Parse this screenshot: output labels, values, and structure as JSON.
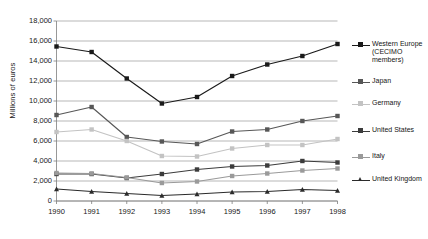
{
  "chart_data": {
    "type": "line",
    "title": "",
    "subtitle": "",
    "xlabel": "",
    "ylabel": "Millions of euros",
    "x": [
      1990,
      1991,
      1992,
      1993,
      1994,
      1995,
      1996,
      1997,
      1998
    ],
    "categories": [
      "1990",
      "1991",
      "1992",
      "1993",
      "1994",
      "1995",
      "1996",
      "1997",
      "1998"
    ],
    "ylim": [
      0,
      18000
    ],
    "ytick_values": [
      0,
      2000,
      4000,
      6000,
      8000,
      10000,
      12000,
      14000,
      16000,
      18000
    ],
    "ytick_labels": [
      "0",
      "2,000",
      "4,000",
      "6,000",
      "8,000",
      "10,000",
      "12,000",
      "14,000",
      "16,000",
      "18,000"
    ],
    "grid": true,
    "grid_axis": "y",
    "legend_position": "right",
    "series": [
      {
        "name": "Western Europe (CECIMO members)",
        "legend_label": "Western Europe (CECIMO members)",
        "color": "#1a1a1a",
        "marker": "square",
        "values": [
          15450,
          14900,
          12250,
          9750,
          10400,
          12500,
          13650,
          14500,
          15700
        ]
      },
      {
        "name": "Japan",
        "legend_label": "Japan",
        "color": "#575757",
        "marker": "square",
        "values": [
          8600,
          9400,
          6400,
          5950,
          5700,
          6950,
          7150,
          8000,
          8500
        ]
      },
      {
        "name": "Germany",
        "legend_label": "Germany",
        "color": "#c3c3c3",
        "marker": "square",
        "values": [
          6900,
          7150,
          6000,
          4500,
          4450,
          5250,
          5600,
          5600,
          6200
        ]
      },
      {
        "name": "United States",
        "legend_label": "United States",
        "color": "#3c3c3c",
        "marker": "square",
        "values": [
          2700,
          2700,
          2300,
          2700,
          3150,
          3450,
          3550,
          4000,
          3850
        ]
      },
      {
        "name": "Italy",
        "legend_label": "Italy",
        "color": "#9a9a9a",
        "marker": "square",
        "values": [
          2800,
          2750,
          2350,
          1800,
          1950,
          2500,
          2750,
          3050,
          3250
        ]
      },
      {
        "name": "United Kingdom",
        "legend_label": "United Kingdom",
        "color": "#2b2b2b",
        "marker": "triangle",
        "values": [
          1200,
          950,
          750,
          550,
          700,
          900,
          950,
          1150,
          1050
        ]
      }
    ]
  },
  "axis": {
    "y_title": "Millions of euros"
  },
  "legend": {
    "items": [
      {
        "label": "Western Europe (CECIMO members)"
      },
      {
        "label": "Japan"
      },
      {
        "label": "Germany"
      },
      {
        "label": "United States"
      },
      {
        "label": "Italy"
      },
      {
        "label": "United Kingdom"
      }
    ]
  }
}
